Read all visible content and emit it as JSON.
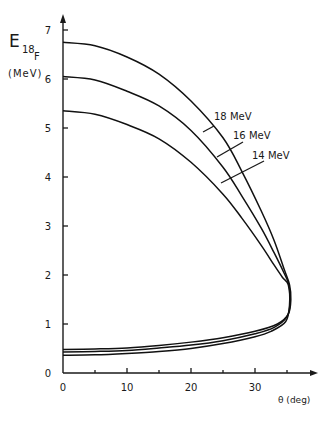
{
  "chart_data": {
    "type": "line",
    "title": "",
    "ylabel": "E18F (MeV)",
    "ylabel_main": "E",
    "ylabel_sub": "18",
    "ylabel_subsub": "F",
    "ylabel_unit": "(MeV)",
    "xlabel": "θ (deg)",
    "xlim": [
      0,
      38
    ],
    "ylim": [
      0,
      7.3
    ],
    "x_ticks": [
      0,
      10,
      20,
      30
    ],
    "x_minor_ticks": [
      5,
      15,
      25,
      35
    ],
    "y_ticks": [
      0,
      1,
      2,
      3,
      4,
      5,
      6,
      7
    ],
    "grid": false,
    "legend": "inline labels",
    "series": [
      {
        "name": "18 MeV",
        "points": [
          [
            0,
            6.75
          ],
          [
            5,
            6.68
          ],
          [
            10,
            6.45
          ],
          [
            15,
            6.1
          ],
          [
            20,
            5.55
          ],
          [
            25,
            4.8
          ],
          [
            28,
            4.1
          ],
          [
            31,
            3.3
          ],
          [
            33,
            2.7
          ],
          [
            34.6,
            2.1
          ],
          [
            35.4,
            1.8
          ],
          [
            35.6,
            1.5
          ],
          [
            35.2,
            1.2
          ],
          [
            33.5,
            1.0
          ],
          [
            30,
            0.85
          ],
          [
            25,
            0.72
          ],
          [
            20,
            0.63
          ],
          [
            15,
            0.56
          ],
          [
            10,
            0.51
          ],
          [
            5,
            0.49
          ],
          [
            0,
            0.48
          ]
        ]
      },
      {
        "name": "16 MeV",
        "points": [
          [
            0,
            6.05
          ],
          [
            5,
            5.98
          ],
          [
            10,
            5.75
          ],
          [
            15,
            5.45
          ],
          [
            20,
            4.95
          ],
          [
            25,
            4.2
          ],
          [
            28,
            3.6
          ],
          [
            31,
            2.95
          ],
          [
            33,
            2.45
          ],
          [
            34.5,
            2.05
          ],
          [
            35.3,
            1.8
          ],
          [
            35.5,
            1.45
          ],
          [
            35.0,
            1.15
          ],
          [
            33.0,
            0.93
          ],
          [
            30,
            0.8
          ],
          [
            25,
            0.66
          ],
          [
            20,
            0.57
          ],
          [
            15,
            0.51
          ],
          [
            10,
            0.46
          ],
          [
            5,
            0.44
          ],
          [
            0,
            0.43
          ]
        ]
      },
      {
        "name": "14 MeV",
        "points": [
          [
            0,
            5.35
          ],
          [
            5,
            5.28
          ],
          [
            10,
            5.07
          ],
          [
            15,
            4.78
          ],
          [
            20,
            4.3
          ],
          [
            25,
            3.65
          ],
          [
            28,
            3.15
          ],
          [
            31,
            2.6
          ],
          [
            33,
            2.2
          ],
          [
            34.3,
            1.95
          ],
          [
            35.2,
            1.8
          ],
          [
            35.4,
            1.4
          ],
          [
            34.8,
            1.05
          ],
          [
            32.5,
            0.85
          ],
          [
            30,
            0.74
          ],
          [
            25,
            0.6
          ],
          [
            20,
            0.5
          ],
          [
            15,
            0.44
          ],
          [
            10,
            0.4
          ],
          [
            5,
            0.37
          ],
          [
            0,
            0.36
          ]
        ]
      }
    ],
    "annotations": [
      {
        "text": "18 MeV",
        "x": 214,
        "y": 120,
        "leader": [
          [
            214,
            126
          ],
          [
            203,
            132
          ]
        ]
      },
      {
        "text": "16 MeV",
        "x": 233,
        "y": 139,
        "leader": [
          [
            243,
            142
          ],
          [
            217,
            157
          ]
        ]
      },
      {
        "text": "14 MeV",
        "x": 252,
        "y": 159,
        "leader": [
          [
            264,
            161
          ],
          [
            221,
            183
          ]
        ]
      }
    ]
  },
  "plot": {
    "origin_px": [
      63,
      373
    ],
    "px_per_x": 6.4,
    "px_per_y": 49,
    "x_axis_end_px": 312,
    "y_axis_top_px": 14
  }
}
